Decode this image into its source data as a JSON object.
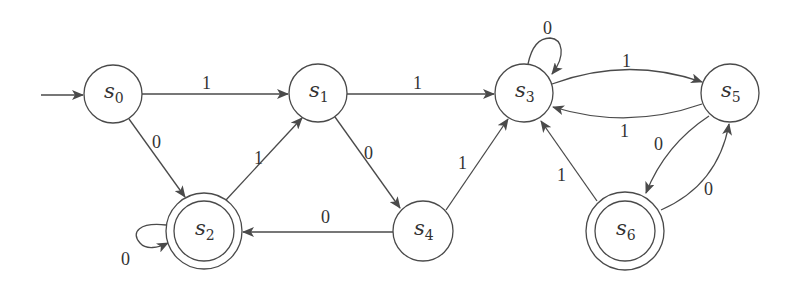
{
  "diagram": {
    "type": "finite-state-automaton",
    "colors": {
      "stroke": "#4a4a4a",
      "text": "#333333",
      "background": "#ffffff"
    },
    "start_state": "s0",
    "states": [
      {
        "id": "s0",
        "name": "s",
        "sub": "0",
        "accepting": false
      },
      {
        "id": "s1",
        "name": "s",
        "sub": "1",
        "accepting": false
      },
      {
        "id": "s2",
        "name": "s",
        "sub": "2",
        "accepting": true
      },
      {
        "id": "s3",
        "name": "s",
        "sub": "3",
        "accepting": false
      },
      {
        "id": "s4",
        "name": "s",
        "sub": "4",
        "accepting": false
      },
      {
        "id": "s5",
        "name": "s",
        "sub": "5",
        "accepting": false
      },
      {
        "id": "s6",
        "name": "s",
        "sub": "6",
        "accepting": true
      }
    ],
    "transitions": [
      {
        "from": "s0",
        "to": "s1",
        "label": "1"
      },
      {
        "from": "s0",
        "to": "s2",
        "label": "0"
      },
      {
        "from": "s2",
        "to": "s1",
        "label": "1"
      },
      {
        "from": "s2",
        "to": "s2",
        "label": "0"
      },
      {
        "from": "s1",
        "to": "s3",
        "label": "1"
      },
      {
        "from": "s1",
        "to": "s4",
        "label": "0"
      },
      {
        "from": "s4",
        "to": "s2",
        "label": "0"
      },
      {
        "from": "s4",
        "to": "s3",
        "label": "1"
      },
      {
        "from": "s3",
        "to": "s3",
        "label": "0"
      },
      {
        "from": "s3",
        "to": "s5",
        "label": "1"
      },
      {
        "from": "s5",
        "to": "s3",
        "label": "1"
      },
      {
        "from": "s5",
        "to": "s6",
        "label": "0"
      },
      {
        "from": "s6",
        "to": "s5",
        "label": "0"
      },
      {
        "from": "s6",
        "to": "s3",
        "label": "1"
      }
    ]
  }
}
